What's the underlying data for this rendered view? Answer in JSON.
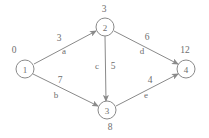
{
  "chart_data": {
    "type": "diagram",
    "title": "",
    "diagram_kind": "directed-weighted-graph",
    "background_color": "#ffffff",
    "stroke_color": "#8a8a8a",
    "text_color": "#6e6e6e",
    "nodes": [
      {
        "id": "1",
        "label": "1",
        "distance": "0",
        "cx": 25,
        "cy": 69,
        "r": 9,
        "dist_x": 14,
        "dist_y": 50
      },
      {
        "id": "2",
        "label": "2",
        "distance": "3",
        "cx": 105,
        "cy": 27,
        "r": 9,
        "dist_x": 104,
        "dist_y": 9
      },
      {
        "id": "3",
        "label": "3",
        "distance": "8",
        "cx": 107,
        "cy": 110,
        "r": 9,
        "dist_x": 110,
        "dist_y": 127
      },
      {
        "id": "4",
        "label": "4",
        "distance": "12",
        "cx": 186,
        "cy": 69,
        "r": 9,
        "dist_x": 185,
        "dist_y": 50
      }
    ],
    "edges": [
      {
        "from": "1",
        "to": "2",
        "weight": "3",
        "name": "a",
        "x1": 34,
        "y1": 64,
        "x2": 96,
        "y2": 31,
        "weight_x": 59,
        "weight_y": 38,
        "name_x": 64,
        "name_y": 51
      },
      {
        "from": "1",
        "to": "3",
        "weight": "7",
        "name": "b",
        "x1": 33,
        "y1": 74,
        "x2": 98,
        "y2": 106,
        "weight_x": 60,
        "weight_y": 80,
        "name_x": 56,
        "name_y": 95
      },
      {
        "from": "2",
        "to": "3",
        "weight": "5",
        "name": "c",
        "x1": 105,
        "y1": 36,
        "x2": 106,
        "y2": 101,
        "weight_x": 113,
        "weight_y": 66,
        "name_x": 97,
        "name_y": 66
      },
      {
        "from": "2",
        "to": "4",
        "weight": "6",
        "name": "d",
        "x1": 114,
        "y1": 31,
        "x2": 178,
        "y2": 64,
        "weight_x": 147,
        "weight_y": 37,
        "name_x": 142,
        "name_y": 51
      },
      {
        "from": "3",
        "to": "4",
        "weight": "4",
        "name": "e",
        "x1": 116,
        "y1": 106,
        "x2": 178,
        "y2": 74,
        "weight_x": 150,
        "weight_y": 80,
        "name_x": 146,
        "name_y": 95
      }
    ],
    "node_distance_labels": [
      "0",
      "3",
      "8",
      "12"
    ],
    "edge_weights": [
      3,
      7,
      5,
      6,
      4
    ],
    "edge_names": [
      "a",
      "b",
      "c",
      "d",
      "e"
    ]
  }
}
